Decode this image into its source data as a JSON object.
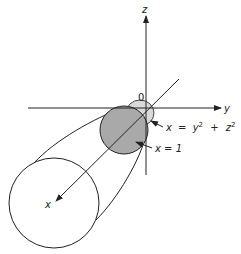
{
  "diagram": {
    "type": "3d-surface-sketch",
    "axes": {
      "z_label": "z",
      "y_label": "y",
      "x_label": "x",
      "origin_label": "0"
    },
    "annotations": {
      "paraboloid": {
        "lhs": "x",
        "eq": "=",
        "t1": "y",
        "p1": "2",
        "plus": "+",
        "t2": "z",
        "p2": "2"
      },
      "plane": "x = 1"
    },
    "colors": {
      "line": "#222222",
      "disk_fill": "#a9a9a9",
      "cap_fill": "#d9d9d9",
      "background": "#ffffff"
    }
  }
}
